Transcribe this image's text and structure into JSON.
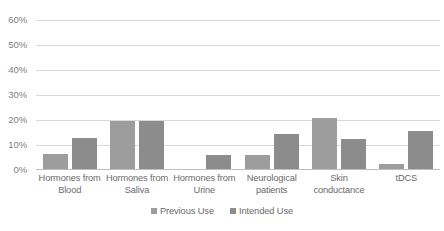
{
  "chart_data": {
    "type": "bar",
    "title": "",
    "subtitle": "",
    "xlabel": "",
    "ylabel": "",
    "ylim": [
      0,
      60
    ],
    "y_ticks": [
      "0%",
      "10%",
      "20%",
      "30%",
      "40%",
      "50%",
      "60%"
    ],
    "y_tick_values": [
      0,
      10,
      20,
      30,
      40,
      50,
      60
    ],
    "grid": "horizontal",
    "legend_position": "bottom",
    "value_suffix": "%",
    "categories": [
      "Hormones from Blood",
      "Hormones from Saliva",
      "Hormones from Urine",
      "Neurological patients",
      "Skin conductance",
      "tDCS"
    ],
    "category_labels": [
      "Hormones from Blood",
      "Hormones from Saliva",
      "Hormones from Urine",
      "Neurological patients",
      "Skin conductance",
      "tDCS"
    ],
    "series": [
      {
        "name": "Previous Use",
        "color": "#9d9d9d",
        "values": [
          6.5,
          19.8,
          0,
          6.0,
          21.0,
          2.3
        ]
      },
      {
        "name": "Intended Use",
        "color": "#8c8c8c",
        "values": [
          13.0,
          19.8,
          6.0,
          14.5,
          12.5,
          15.5
        ]
      }
    ]
  },
  "legend": {
    "items": [
      {
        "label": "Previous Use",
        "swatch": "previous-use-swatch"
      },
      {
        "label": "Intended Use",
        "swatch": "intended-use-swatch"
      }
    ]
  }
}
